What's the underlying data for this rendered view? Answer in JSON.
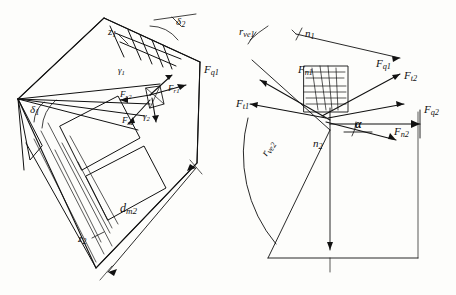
{
  "figure": {
    "stroke_color": "#111111",
    "background": "#fdfdfb"
  },
  "labels": {
    "z1": "z",
    "z1_sub": "1",
    "z2": "z",
    "z2_sub": "2",
    "delta2": "δ",
    "delta2_sub": "2",
    "delta1": "δ",
    "delta1_sub": "1",
    "gamma1": "γ",
    "gamma1_sub": "1",
    "gamma2": "γ",
    "gamma2_sub": "2",
    "fn1": "F",
    "fn1_sub": "n1",
    "fn2": "F",
    "fn2_sub": "n2",
    "fg1": "F",
    "fg1_sub": "q1",
    "fg2": "F",
    "fg2_sub": "q2",
    "ft1": "F",
    "ft1_sub": "t1",
    "ft2": "F",
    "ft2_sub": "t2",
    "fr1": "F",
    "fr1_sub": "r1",
    "fr2": "F",
    "fr2_sub": "r2",
    "fx2": "F",
    "fx2_sub": "x2",
    "n1": "n",
    "n1_sub": "1",
    "n2": "n",
    "n2_sub": "2",
    "rve1": "r",
    "rve1_sub": "ve1",
    "rve2": "r",
    "rve2_sub": "ve2",
    "dm2": "d",
    "dm2_sub": "m2",
    "alpha": "α"
  },
  "annotations": [
    {
      "name": "pinion-tooth-count",
      "text": "z1"
    },
    {
      "name": "wheel-tooth-count",
      "text": "z2"
    },
    {
      "name": "pitch-angle-2",
      "text": "δ2"
    },
    {
      "name": "pitch-angle-1",
      "text": "δ1"
    },
    {
      "name": "normal-force-1",
      "text": "Fn1"
    },
    {
      "name": "normal-force-2",
      "text": "Fn2"
    },
    {
      "name": "tangential-force-1",
      "text": "Ft1"
    },
    {
      "name": "tangential-force-2",
      "text": "Ft2"
    },
    {
      "name": "radial-force-1",
      "text": "Fr1"
    },
    {
      "name": "radial-force-2",
      "text": "Fr2"
    },
    {
      "name": "axial-force-2",
      "text": "Fx2"
    },
    {
      "name": "resultant-force-1",
      "text": "Fq1"
    },
    {
      "name": "resultant-force-2",
      "text": "Fq2"
    },
    {
      "name": "speed-1",
      "text": "n1"
    },
    {
      "name": "speed-2",
      "text": "n2"
    },
    {
      "name": "mean-diameter-2",
      "text": "dm2"
    },
    {
      "name": "pressure-angle",
      "text": "α"
    },
    {
      "name": "radius-ve1",
      "text": "rve1"
    },
    {
      "name": "radius-ve2",
      "text": "rve2"
    }
  ]
}
